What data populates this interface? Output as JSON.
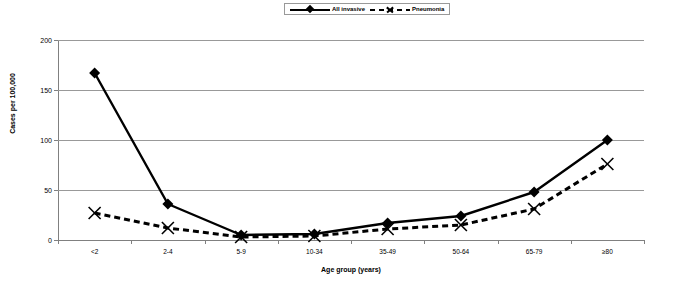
{
  "chart_data": {
    "type": "line",
    "title": "",
    "xlabel": "Age group (years)",
    "ylabel": "Cases per 100,000",
    "categories": [
      "<2",
      "2-4",
      "5-9",
      "10-34",
      "35-49",
      "50-64",
      "65-79",
      "≥80"
    ],
    "yticks": [
      0,
      50,
      100,
      150,
      200
    ],
    "ylim": [
      0,
      200
    ],
    "grid": true,
    "legend_position": "top-center",
    "series": [
      {
        "name": "All invasive",
        "marker": "diamond",
        "line_style": "solid",
        "color": "#000000",
        "values": [
          167,
          36,
          5,
          6,
          17,
          24,
          48,
          100
        ]
      },
      {
        "name": "Pneumonia",
        "marker": "x",
        "line_style": "dashed",
        "color": "#000000",
        "values": [
          27,
          12,
          3,
          4,
          11,
          15,
          31,
          76
        ]
      }
    ]
  },
  "legend": {
    "entries": [
      {
        "label": "All invasive"
      },
      {
        "label": "Pneumonia"
      }
    ]
  }
}
